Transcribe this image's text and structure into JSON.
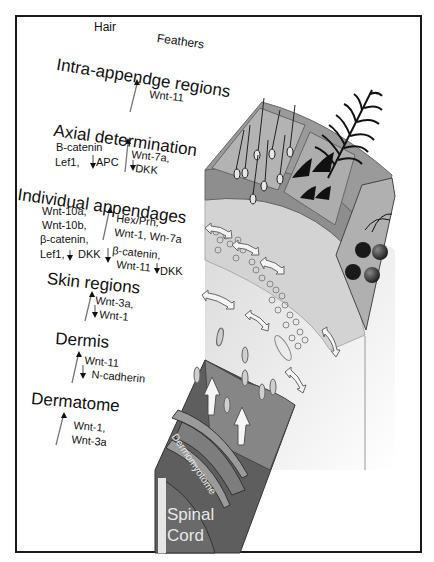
{
  "figure": {
    "column_labels": {
      "hair": "Hair",
      "feathers": "Feathers"
    },
    "levels": [
      {
        "id": "intra-appendage",
        "title": "Intra-appendge regions",
        "up_genes": [
          "Wnt-11"
        ],
        "down_genes": []
      },
      {
        "id": "axial-determination",
        "title": "Axial determination",
        "left_genes": [
          "B-catenin",
          "Lef1,"
        ],
        "left_down": "APC",
        "right_up": [
          "Wnt-7a,"
        ],
        "right_down": "DKK"
      },
      {
        "id": "individual-appendages",
        "title": "Individual appendages",
        "left_genes": [
          "Wnt-10a,",
          "Wnt-10b,",
          "β-catenin,",
          "Lef1,"
        ],
        "left_down": "DKK",
        "right_up": [
          "Hex/Prh,",
          "Wnt-1, Wn-7a"
        ],
        "right_down_genes": [
          "β-catenin,",
          "Wnt-11"
        ],
        "right_down": "DKK"
      },
      {
        "id": "skin-regions",
        "title": "Skin regions",
        "up_genes": [
          "Wnt-3a,"
        ],
        "down_genes": [
          "Wnt-1"
        ]
      },
      {
        "id": "dermis",
        "title": "Dermis",
        "up_genes": [
          "Wnt-11"
        ],
        "down_genes": [
          "N-cadherin"
        ]
      },
      {
        "id": "dermatome",
        "title": "Dermatome",
        "up_genes": [
          "Wnt-1,",
          "Wnt-3a"
        ],
        "down_genes": []
      }
    ],
    "illustration_labels": {
      "dermomyotome": "Dermomyotome",
      "spinal_cord_line1": "Spinal",
      "spinal_cord_line2": "Cord"
    },
    "colors": {
      "dark_block": "#5c5c5c",
      "mid_gray": "#8a8a8a",
      "light_panel": "#a9a9a9",
      "dermis_fill": "#cfcfcf",
      "frame": "#1a1a1a"
    }
  }
}
